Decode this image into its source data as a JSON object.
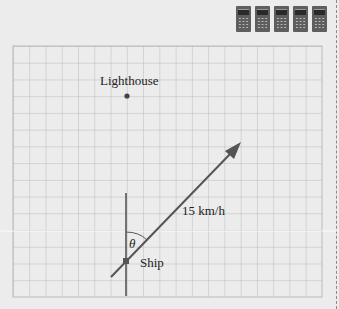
{
  "toolbar": {
    "tools": [
      {
        "icon": "calculator-icon"
      },
      {
        "icon": "calculator-icon"
      },
      {
        "icon": "calculator-icon"
      },
      {
        "icon": "calculator-icon"
      },
      {
        "icon": "calculator-icon"
      }
    ]
  },
  "diagram": {
    "grid": {
      "columns": 19,
      "rows": 15,
      "color": "#b9b9b9",
      "background": "#ebebeb"
    },
    "lighthouse": {
      "label": "Lighthouse"
    },
    "ship": {
      "label": "Ship"
    },
    "velocity": {
      "label": "15 km/h"
    },
    "angle": {
      "label": "θ"
    },
    "line_color": "#555555"
  }
}
